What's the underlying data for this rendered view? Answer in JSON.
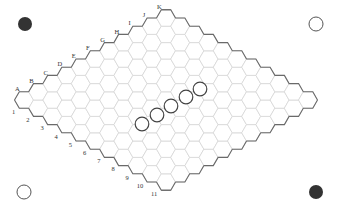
{
  "board": {
    "type": "hex",
    "size": 11,
    "letters": [
      "A",
      "B",
      "C",
      "D",
      "E",
      "F",
      "G",
      "H",
      "I",
      "J",
      "K"
    ],
    "numbers": [
      "1",
      "2",
      "3",
      "4",
      "5",
      "6",
      "7",
      "8",
      "9",
      "10",
      "11"
    ],
    "colors": {
      "grid_line": "#d6d6d6",
      "border_line": "#6a6a6a",
      "black": "#333333",
      "white": "#ffffff"
    }
  },
  "corner_markers": [
    {
      "position": "top-left",
      "color": "black",
      "x": 25,
      "y": 24
    },
    {
      "position": "top-right",
      "color": "white",
      "x": 316,
      "y": 24
    },
    {
      "position": "bottom-left",
      "color": "white",
      "x": 24,
      "y": 192
    },
    {
      "position": "bottom-right",
      "color": "black",
      "x": 316,
      "y": 192
    }
  ],
  "stones": [
    {
      "color": "white",
      "x": 142,
      "y": 124
    },
    {
      "color": "white",
      "x": 157,
      "y": 115
    },
    {
      "color": "white",
      "x": 171,
      "y": 106
    },
    {
      "color": "white",
      "x": 186,
      "y": 97
    },
    {
      "color": "white",
      "x": 200,
      "y": 89
    }
  ]
}
